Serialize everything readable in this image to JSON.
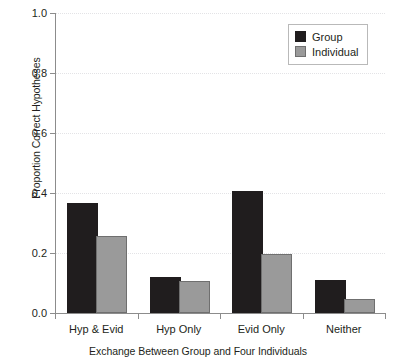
{
  "chart_data": {
    "type": "bar",
    "title": "",
    "xlabel": "Exchange Between Group and Four Individuals",
    "ylabel": "Proportion Correct Hypotheses",
    "categories": [
      "Hyp & Evid",
      "Hyp Only",
      "Evid Only",
      "Neither"
    ],
    "series": [
      {
        "name": "Group",
        "color": "#201d1e",
        "values": [
          0.36,
          0.115,
          0.4,
          0.105
        ]
      },
      {
        "name": "Individual",
        "color": "#9a9a9a",
        "values": [
          0.25,
          0.1,
          0.19,
          0.04
        ]
      }
    ],
    "ylim": [
      0.0,
      1.0
    ],
    "yticks": [
      0.0,
      0.2,
      0.4,
      0.6,
      0.8,
      1.0
    ],
    "ytick_labels": [
      "0.0",
      "0.2",
      "0.4",
      "0.6",
      "0.8",
      "1.0"
    ],
    "grid": true,
    "grid_axis": "y",
    "legend_position": "top-right",
    "legend_entries": [
      "Group",
      "Individual"
    ]
  }
}
